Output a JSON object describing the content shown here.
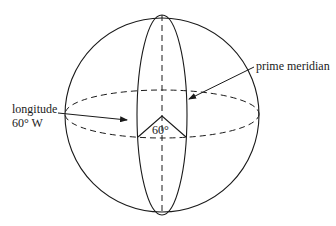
{
  "diagram": {
    "labels": {
      "longitude_line1": "longitude",
      "longitude_line2": "60° W",
      "prime_meridian": "prime meridian",
      "angle": "60°"
    },
    "elements": {
      "sphere": "circle outline",
      "meridian": "solid vertical ellipse (prime meridian / 60°W meridian)",
      "equator": "dashed horizontal ellipse",
      "axis": "dashed vertical polar axis",
      "angle_wedge": "60° angle at center"
    },
    "colors": {
      "stroke": "#1a1a1a",
      "background": "#ffffff"
    }
  }
}
